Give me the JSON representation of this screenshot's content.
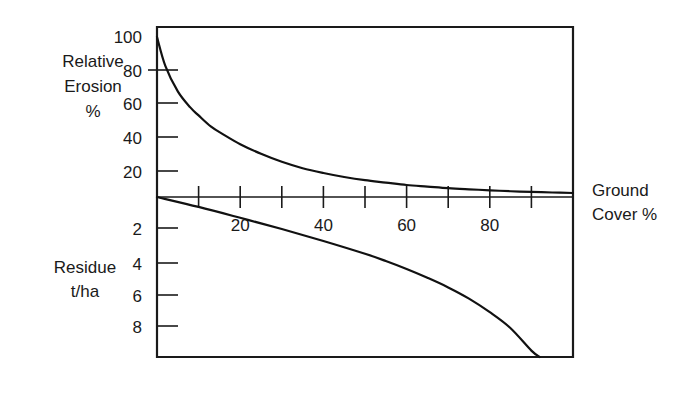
{
  "chart_data": {
    "type": "line",
    "title": "",
    "xlabel": "Ground Cover %",
    "grid": false,
    "legend": "none",
    "xlim": [
      0,
      100
    ],
    "x_ticks": [
      10,
      20,
      30,
      40,
      50,
      60,
      70,
      80,
      90
    ],
    "x_tick_labels": [
      "",
      "20",
      "",
      "40",
      "",
      "60",
      "",
      "80",
      ""
    ],
    "panels": [
      {
        "name": "relative-erosion",
        "ylabel": "Relative Erosion %",
        "ylabel_lines": [
          "Relative",
          "Erosion",
          "%"
        ],
        "ylim": [
          0,
          100
        ],
        "y_ticks": [
          20,
          40,
          60,
          80,
          100
        ],
        "y_tick_labels": [
          "20",
          "40",
          "60",
          "80",
          "100"
        ],
        "series": [
          {
            "name": "Relative erosion vs ground cover",
            "x": [
              0,
              2,
              5,
              8,
              10,
              13,
              16,
              20,
              25,
              30,
              35,
              40,
              45,
              50,
              55,
              60,
              65,
              70,
              75,
              80,
              85,
              90,
              95,
              100
            ],
            "y": [
              100,
              82,
              66,
              56,
              51,
              44,
              39,
              33,
              27,
              22,
              18,
              15,
              12.5,
              10.5,
              9,
              7.5,
              6.5,
              5.5,
              4.8,
              4.2,
              3.6,
              3.2,
              2.8,
              2.5
            ]
          }
        ]
      },
      {
        "name": "residue",
        "ylabel": "Residue t/ha",
        "ylabel_lines": [
          "Residue",
          "t/ha"
        ],
        "ylim": [
          0,
          10
        ],
        "y_ticks": [
          2,
          4,
          6,
          8
        ],
        "y_tick_labels": [
          "2",
          "4",
          "6",
          "8"
        ],
        "y_axis_inverted": true,
        "series": [
          {
            "name": "Residue vs ground cover",
            "x": [
              0,
              10,
              20,
              30,
              40,
              50,
              55,
              60,
              65,
              70,
              75,
              80,
              85,
              90,
              92
            ],
            "y": [
              0,
              0.62,
              1.3,
              2.0,
              2.75,
              3.55,
              4.0,
              4.5,
              5.05,
              5.65,
              6.35,
              7.2,
              8.2,
              9.6,
              10
            ]
          }
        ]
      }
    ]
  },
  "axes": {
    "x_axis_title_line1": "Ground",
    "x_axis_title_line2": "Cover %"
  }
}
